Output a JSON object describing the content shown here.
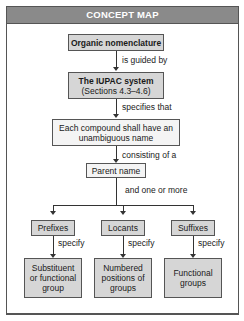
{
  "header": {
    "title": "CONCEPT MAP"
  },
  "nodes": {
    "organic": {
      "label": "Organic nomenclature"
    },
    "iupac": {
      "line1": "The IUPAC system",
      "line2": "(Sections 4.3–4.6)"
    },
    "each": {
      "line1": "Each compound shall have an",
      "line2": "unambiguous name"
    },
    "parent": {
      "label": "Parent name"
    },
    "prefixes": {
      "label": "Prefixes"
    },
    "locants": {
      "label": "Locants"
    },
    "suffixes": {
      "label": "Suffixes"
    },
    "substituent": {
      "line1": "Substituent",
      "line2": "or functional",
      "line3": "group"
    },
    "numbered": {
      "line1": "Numbered",
      "line2": "positions of",
      "line3": "groups"
    },
    "functional": {
      "line1": "Functional",
      "line2": "groups"
    }
  },
  "links": {
    "guided": "is guided by",
    "specifies": "specifies that",
    "consisting": "consisting of a",
    "oneormore": "and one or more",
    "specify1": "specify",
    "specify2": "specify",
    "specify3": "specify"
  },
  "colors": {
    "header_bg": "#8a8a8a",
    "box_bg": "#d6d6d6",
    "border": "#555555"
  }
}
